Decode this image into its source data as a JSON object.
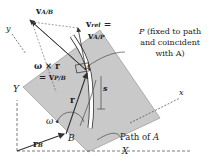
{
  "diagram": {
    "type": "kinematics-rotating-frame",
    "colors": {
      "plate": "#c9c9c9",
      "plate_edge": "#8a8a8a",
      "lines": "#333333",
      "slot": "#ffffff"
    },
    "labels": {
      "v_ab_main": "v",
      "v_ab_sub": "A/B",
      "v_rel_main": "v",
      "v_rel_sub": "rel",
      "v_rel_eq": " =",
      "v_ap_main": "v",
      "v_ap_sub": "A/P",
      "omega_cross_r": "ω × r",
      "eq_vpb_prefix": "= v",
      "vpb_sub": "P/B",
      "P_note_line1": "P (fixed to path",
      "P_note_line2": "and coincident",
      "P_note_line3": "with A)",
      "A": "A",
      "s": "s",
      "r": "r",
      "omega": "ω",
      "B": "B",
      "path_of_A": "Path of A",
      "r_B_main": "r",
      "r_B_sub": "B",
      "X": "X",
      "Y": "Y",
      "x": "x",
      "y": "y"
    }
  }
}
